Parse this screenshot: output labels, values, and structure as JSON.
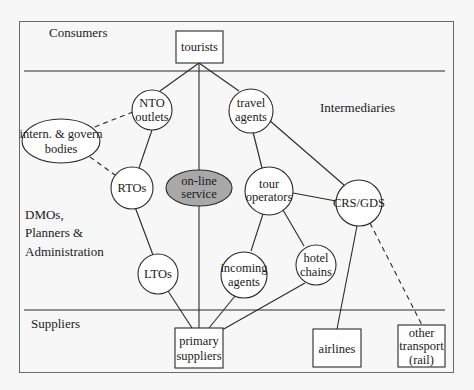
{
  "diagram": {
    "colors": {
      "background": "#f7f7f7",
      "stroke": "#2a2a2a",
      "node_fill": "#ffffff",
      "highlight_fill": "#a8a8a8"
    },
    "sections": {
      "consumers": "Consumers",
      "intermediaries": "Intermediaries",
      "dmos": [
        "DMOs,",
        "Planners &",
        "Administration"
      ],
      "suppliers": "Suppliers"
    },
    "nodes": {
      "tourists": [
        "tourists"
      ],
      "nto_outlets": [
        "NTO",
        "outlets"
      ],
      "travel_agents": [
        "travel",
        "agents"
      ],
      "intern_bodies": [
        "intern. & govern",
        "bodies"
      ],
      "rtos": [
        "RTOs"
      ],
      "online_service": [
        "on-line",
        "service"
      ],
      "tour_operators": [
        "tour",
        "operators"
      ],
      "crs_gds": [
        "CRS/GDS"
      ],
      "ltos": [
        "LTOs"
      ],
      "incoming_agents": [
        "incoming",
        "agents"
      ],
      "hotel_chains": [
        "hotel",
        "chains"
      ],
      "primary_suppliers": [
        "primary",
        "suppliers"
      ],
      "airlines": [
        "airlines"
      ],
      "other_transport": [
        "other",
        "transport",
        "(rail)"
      ]
    },
    "edges": [
      {
        "from": "tourists",
        "to": "nto_outlets",
        "style": "solid"
      },
      {
        "from": "tourists",
        "to": "travel_agents",
        "style": "solid"
      },
      {
        "from": "tourists",
        "to": "primary_suppliers",
        "style": "solid"
      },
      {
        "from": "nto_outlets",
        "to": "intern_bodies",
        "style": "dashed"
      },
      {
        "from": "nto_outlets",
        "to": "rtos",
        "style": "solid"
      },
      {
        "from": "intern_bodies",
        "to": "rtos",
        "style": "dashed"
      },
      {
        "from": "rtos",
        "to": "ltos",
        "style": "solid"
      },
      {
        "from": "travel_agents",
        "to": "tour_operators",
        "style": "solid"
      },
      {
        "from": "travel_agents",
        "to": "crs_gds",
        "style": "solid"
      },
      {
        "from": "tour_operators",
        "to": "crs_gds",
        "style": "solid"
      },
      {
        "from": "tour_operators",
        "to": "incoming_agents",
        "style": "solid"
      },
      {
        "from": "tour_operators",
        "to": "hotel_chains",
        "style": "solid"
      },
      {
        "from": "ltos",
        "to": "primary_suppliers",
        "style": "solid"
      },
      {
        "from": "incoming_agents",
        "to": "primary_suppliers",
        "style": "solid"
      },
      {
        "from": "hotel_chains",
        "to": "primary_suppliers",
        "style": "solid"
      },
      {
        "from": "crs_gds",
        "to": "airlines",
        "style": "solid"
      },
      {
        "from": "crs_gds",
        "to": "other_transport",
        "style": "dashed"
      }
    ]
  }
}
